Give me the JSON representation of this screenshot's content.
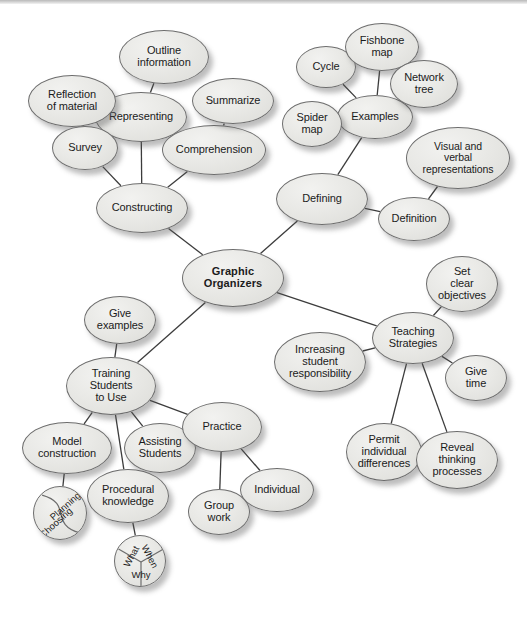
{
  "diagram": {
    "type": "concept-map",
    "background_color": "#ffffff",
    "node_fill_color": "#e9e9e6",
    "node_stroke_color": "#6d6d6d",
    "edge_color": "#3c3c3c",
    "text_color": "#1b1b1b"
  },
  "nodes": [
    {
      "id": "graphic-organizers",
      "label": "Graphic\nOrganizers",
      "cx": 233,
      "cy": 278,
      "rx": 51,
      "ry": 29,
      "font": 11,
      "bold": true
    },
    {
      "id": "constructing",
      "label": "Constructing",
      "cx": 142,
      "cy": 208,
      "rx": 46,
      "ry": 25,
      "font": 11,
      "bold": false
    },
    {
      "id": "representing",
      "label": "Representing",
      "cx": 141,
      "cy": 117,
      "rx": 46,
      "ry": 25,
      "font": 11,
      "bold": false
    },
    {
      "id": "outline-information",
      "label": "Outline\ninformation",
      "cx": 164,
      "cy": 57,
      "rx": 45,
      "ry": 27,
      "font": 11,
      "bold": false
    },
    {
      "id": "reflection-of-material",
      "label": "Reflection\nof material",
      "cx": 72,
      "cy": 101,
      "rx": 44,
      "ry": 26,
      "font": 11,
      "bold": false
    },
    {
      "id": "survey",
      "label": "Survey",
      "cx": 85,
      "cy": 148,
      "rx": 33,
      "ry": 22,
      "font": 11,
      "bold": false
    },
    {
      "id": "comprehension",
      "label": "Comprehension",
      "cx": 214,
      "cy": 150,
      "rx": 52,
      "ry": 25,
      "font": 11,
      "bold": false
    },
    {
      "id": "summarize",
      "label": "Summarize",
      "cx": 233,
      "cy": 101,
      "rx": 41,
      "ry": 23,
      "font": 11,
      "bold": false
    },
    {
      "id": "defining",
      "label": "Defining",
      "cx": 322,
      "cy": 199,
      "rx": 46,
      "ry": 26,
      "font": 11,
      "bold": false
    },
    {
      "id": "examples",
      "label": "Examples",
      "cx": 375,
      "cy": 117,
      "rx": 38,
      "ry": 22,
      "font": 11,
      "bold": false
    },
    {
      "id": "cycle",
      "label": "Cycle",
      "cx": 326,
      "cy": 67,
      "rx": 30,
      "ry": 21,
      "font": 11,
      "bold": false
    },
    {
      "id": "fishbone-map",
      "label": "Fishbone\nmap",
      "cx": 382,
      "cy": 47,
      "rx": 37,
      "ry": 24,
      "font": 11,
      "bold": false
    },
    {
      "id": "network-tree",
      "label": "Network\ntree",
      "cx": 424,
      "cy": 84,
      "rx": 34,
      "ry": 24,
      "font": 11,
      "bold": false
    },
    {
      "id": "spider-map",
      "label": "Spider\nmap",
      "cx": 312,
      "cy": 124,
      "rx": 30,
      "ry": 23,
      "font": 11,
      "bold": false
    },
    {
      "id": "visual-verbal-representations",
      "label": "Visual and\nverbal\nrepresentations",
      "cx": 458,
      "cy": 158,
      "rx": 52,
      "ry": 31,
      "font": 10.5,
      "bold": false
    },
    {
      "id": "definition",
      "label": "Definition",
      "cx": 414,
      "cy": 219,
      "rx": 36,
      "ry": 22,
      "font": 11,
      "bold": false
    },
    {
      "id": "teaching-strategies",
      "label": "Teaching\nStrategies",
      "cx": 413,
      "cy": 338,
      "rx": 41,
      "ry": 26,
      "font": 11,
      "bold": false
    },
    {
      "id": "set-clear-objectives",
      "label": "Set\nclear\nobjectives",
      "cx": 462,
      "cy": 284,
      "rx": 36,
      "ry": 28,
      "font": 11,
      "bold": false
    },
    {
      "id": "increasing-student-responsibility",
      "label": "Increasing\nstudent\nresponsibility",
      "cx": 320,
      "cy": 362,
      "rx": 46,
      "ry": 30,
      "font": 11,
      "bold": false
    },
    {
      "id": "give-time",
      "label": "Give\ntime",
      "cx": 476,
      "cy": 378,
      "rx": 31,
      "ry": 23,
      "font": 11,
      "bold": false
    },
    {
      "id": "permit-individual-differences",
      "label": "Permit\nindividual\ndifferences",
      "cx": 384,
      "cy": 452,
      "rx": 38,
      "ry": 29,
      "font": 11,
      "bold": false
    },
    {
      "id": "reveal-thinking-processes",
      "label": "Reveal\nthinking\nprocesses",
      "cx": 457,
      "cy": 460,
      "rx": 41,
      "ry": 29,
      "font": 11,
      "bold": false
    },
    {
      "id": "training-students-to-use",
      "label": "Training\nStudents\nto Use",
      "cx": 111,
      "cy": 386,
      "rx": 45,
      "ry": 29,
      "font": 11,
      "bold": false
    },
    {
      "id": "give-examples",
      "label": "Give\nexamples",
      "cx": 120,
      "cy": 320,
      "rx": 36,
      "ry": 24,
      "font": 11,
      "bold": false
    },
    {
      "id": "model-construction",
      "label": "Model\nconstruction",
      "cx": 67,
      "cy": 448,
      "rx": 45,
      "ry": 26,
      "font": 11,
      "bold": false
    },
    {
      "id": "assisting-students",
      "label": "Assisting\nStudents",
      "cx": 160,
      "cy": 448,
      "rx": 36,
      "ry": 25,
      "font": 11,
      "bold": false
    },
    {
      "id": "procedural-knowledge",
      "label": "Procedural\nknowledge",
      "cx": 128,
      "cy": 496,
      "rx": 41,
      "ry": 27,
      "font": 11,
      "bold": false
    },
    {
      "id": "practice",
      "label": "Practice",
      "cx": 222,
      "cy": 427,
      "rx": 40,
      "ry": 25,
      "font": 11,
      "bold": false
    },
    {
      "id": "group-work",
      "label": "Group\nwork",
      "cx": 219,
      "cy": 512,
      "rx": 31,
      "ry": 23,
      "font": 11,
      "bold": false
    },
    {
      "id": "individual",
      "label": "Individual",
      "cx": 277,
      "cy": 490,
      "rx": 37,
      "ry": 22,
      "font": 11,
      "bold": false
    }
  ],
  "special_nodes": [
    {
      "id": "planning-choosing",
      "kind": "yin-yang-circle",
      "cx": 60,
      "cy": 513,
      "r": 27,
      "segments": [
        {
          "label": "Planning",
          "rotation": -42
        },
        {
          "label": "Choosing",
          "rotation": -42
        }
      ]
    },
    {
      "id": "what-when-why",
      "kind": "three-segment-circle",
      "cx": 140,
      "cy": 561,
      "r": 26,
      "segments": [
        {
          "label": "What",
          "rotation": -62
        },
        {
          "label": "When",
          "rotation": 62
        },
        {
          "label": "Why",
          "rotation": 0
        }
      ]
    }
  ],
  "edges": [
    {
      "from": "graphic-organizers",
      "to": "constructing"
    },
    {
      "from": "graphic-organizers",
      "to": "defining"
    },
    {
      "from": "graphic-organizers",
      "to": "teaching-strategies"
    },
    {
      "from": "graphic-organizers",
      "to": "training-students-to-use"
    },
    {
      "from": "constructing",
      "to": "representing"
    },
    {
      "from": "constructing",
      "to": "survey"
    },
    {
      "from": "constructing",
      "to": "comprehension"
    },
    {
      "from": "representing",
      "to": "outline-information"
    },
    {
      "from": "reflection-of-material",
      "to": "survey"
    },
    {
      "from": "comprehension",
      "to": "summarize"
    },
    {
      "from": "defining",
      "to": "examples"
    },
    {
      "from": "defining",
      "to": "definition"
    },
    {
      "from": "examples",
      "to": "cycle"
    },
    {
      "from": "examples",
      "to": "fishbone-map"
    },
    {
      "from": "examples",
      "to": "network-tree"
    },
    {
      "from": "examples",
      "to": "spider-map"
    },
    {
      "from": "definition",
      "to": "visual-verbal-representations"
    },
    {
      "from": "teaching-strategies",
      "to": "set-clear-objectives"
    },
    {
      "from": "teaching-strategies",
      "to": "increasing-student-responsibility"
    },
    {
      "from": "teaching-strategies",
      "to": "give-time"
    },
    {
      "from": "teaching-strategies",
      "to": "permit-individual-differences"
    },
    {
      "from": "teaching-strategies",
      "to": "reveal-thinking-processes"
    },
    {
      "from": "training-students-to-use",
      "to": "give-examples"
    },
    {
      "from": "training-students-to-use",
      "to": "model-construction"
    },
    {
      "from": "training-students-to-use",
      "to": "assisting-students"
    },
    {
      "from": "training-students-to-use",
      "to": "procedural-knowledge"
    },
    {
      "from": "training-students-to-use",
      "to": "practice"
    },
    {
      "from": "model-construction",
      "to": "planning-choosing"
    },
    {
      "from": "procedural-knowledge",
      "to": "what-when-why"
    },
    {
      "from": "practice",
      "to": "group-work"
    },
    {
      "from": "practice",
      "to": "individual"
    }
  ]
}
